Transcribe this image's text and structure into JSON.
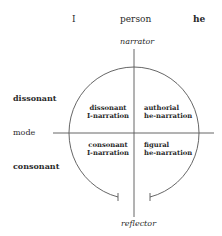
{
  "diagram": {
    "top_axis": {
      "left": "I",
      "center": "person",
      "right": "he"
    },
    "vertical_axis": {
      "top": "narrator",
      "bottom": "reflector"
    },
    "left_axis": {
      "upper": "dissonant",
      "middle": "mode",
      "lower": "consonant"
    },
    "quadrants": {
      "top_left": {
        "line1": "dissonant",
        "line2": "I-narration"
      },
      "top_right": {
        "line1": "authorial",
        "line2": "he-narration"
      },
      "bottom_left": {
        "line1": "consonant",
        "line2": "I-narration"
      },
      "bottom_right": {
        "line1": "figural",
        "line2": "he-narration"
      }
    },
    "colors": {
      "line": "#555555",
      "text": "#2a2a2a"
    }
  }
}
